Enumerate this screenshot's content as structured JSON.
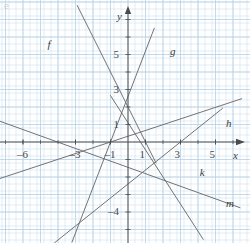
{
  "figure": {
    "kind": "coordinate-graph",
    "background_color": "#ffffff",
    "grid_minor_color": "#cfe0ee",
    "grid_major_color": "#b9d2e6",
    "axis_color": "#4a4a4a",
    "line_color": "#6b6b6b",
    "corner_mark": "e"
  },
  "axes": {
    "x_axis_label": "x",
    "y_axis_label": "y",
    "origin_px": {
      "x": 128,
      "y": 142
    },
    "unit_px": 17.5,
    "x_range": [
      -7.3,
      6.5
    ],
    "y_range": [
      -5.5,
      7.8
    ],
    "x_ticks": [
      {
        "value": -6,
        "label": "–6"
      },
      {
        "value": -3,
        "label": "–3"
      },
      {
        "value": -1,
        "label": "–1"
      },
      {
        "value": 1,
        "label": "1"
      },
      {
        "value": 3,
        "label": "3"
      },
      {
        "value": 5,
        "label": "5"
      }
    ],
    "y_ticks": [
      {
        "value": 1,
        "label": "1"
      },
      {
        "value": 3,
        "label": "3"
      },
      {
        "value": 5,
        "label": "5"
      },
      {
        "value": -1,
        "label": ""
      },
      {
        "value": -4,
        "label": "–4"
      }
    ],
    "y_tick_labels_visible": [
      "1",
      "3",
      "5",
      "–4"
    ]
  },
  "chart_data": {
    "type": "line",
    "title": "",
    "xlabel": "x",
    "ylabel": "y",
    "xlim": [
      -7.3,
      6.5
    ],
    "ylim": [
      -5.5,
      7.8
    ],
    "grid": true,
    "legend": "inline-endpoint-labels",
    "series": [
      {
        "name": "f",
        "label": "f",
        "slope": -2.0,
        "intercept": 2.0,
        "x_start": -2.9,
        "x_end": 1.6,
        "label_pos": {
          "x": -4.6,
          "y": 5.9
        }
      },
      {
        "name": "g",
        "label": "g",
        "slope": 2.6,
        "intercept": 2.6,
        "x_start": -3.2,
        "x_end": 1.5,
        "label_pos": {
          "x": 2.4,
          "y": 5.5
        }
      },
      {
        "name": "h",
        "label": "h",
        "slope": 0.33,
        "intercept": 0.33,
        "x_start": -7.3,
        "x_end": 6.5,
        "label_pos": {
          "x": 5.6,
          "y": 1.35
        }
      },
      {
        "name": "k",
        "label": "k",
        "slope": 0.8,
        "intercept": -2.4,
        "x_start": -4.2,
        "x_end": 5.4,
        "label_pos": {
          "x": 4.1,
          "y": -1.45
        }
      },
      {
        "name": "m",
        "label": "m",
        "slope": -0.36,
        "intercept": -1.45,
        "x_start": -7.3,
        "x_end": 6.4,
        "label_pos": {
          "x": 5.6,
          "y": -3.2
        }
      },
      {
        "name": "n",
        "label": "",
        "slope": -1.55,
        "intercept": 1.1,
        "x_start": -1.0,
        "x_end": 4.3,
        "label_pos": {
          "x": 0,
          "y": 0
        }
      }
    ]
  },
  "labels": {
    "f": "f",
    "g": "g",
    "h": "h",
    "k": "k",
    "m": "m",
    "x": "x",
    "y": "y"
  }
}
